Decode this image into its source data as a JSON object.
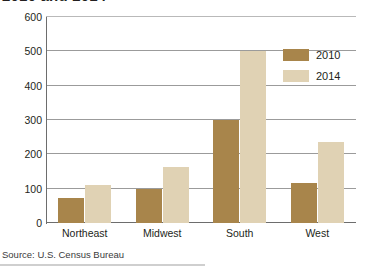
{
  "chart_data": {
    "type": "bar",
    "title": "2010 and 2014",
    "categories": [
      "Northeast",
      "Midwest",
      "South",
      "West"
    ],
    "series": [
      {
        "name": "2010",
        "color": "#a8854b",
        "values": [
          72,
          100,
          300,
          118
        ]
      },
      {
        "name": "2014",
        "color": "#e0d2b4",
        "values": [
          112,
          163,
          500,
          235
        ]
      }
    ],
    "xlabel": "",
    "ylabel": "",
    "ylim": [
      0,
      600
    ],
    "yticks": [
      0,
      100,
      200,
      300,
      400,
      500,
      600
    ],
    "ytick_labels": [
      "0",
      "100",
      "200",
      "300",
      "400",
      "500",
      "600"
    ],
    "grid": true,
    "legend_position": "upper right",
    "source": "Source: U.S. Census Bureau"
  }
}
